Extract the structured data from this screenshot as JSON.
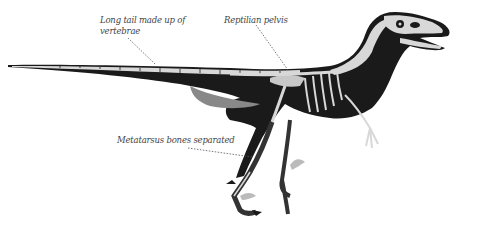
{
  "figure": {
    "labels": [
      {
        "id": "tail",
        "text_line1": "Long tail made up of",
        "text_line2": "vertebrae"
      },
      {
        "id": "pelvis",
        "text": "Reptilian pelvis"
      },
      {
        "id": "metatarsus",
        "text": "Metatarsus bones separated"
      }
    ],
    "colors": {
      "body": "#1a1a1a",
      "bone": "#d8d8d8",
      "bone_shade": "#a8a8a8",
      "label_text": "#444444",
      "leader_line": "#555555",
      "background": "#ffffff"
    }
  }
}
